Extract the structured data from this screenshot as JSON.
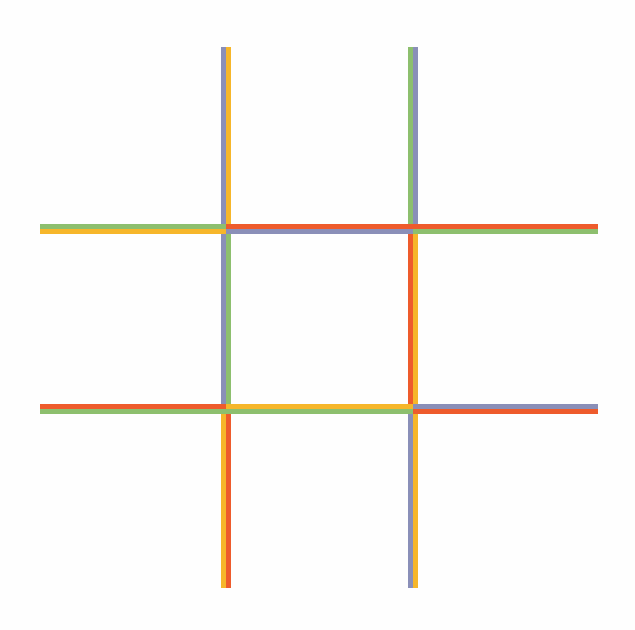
{
  "colors": {
    "gray": "#8a8fb8",
    "yellow": "#f6b62a",
    "green": "#8dbf6e",
    "red": "#ee5b2c",
    "background": "#fefefe"
  },
  "grid": {
    "vertical_lines": [
      {
        "x": 221,
        "segments": [
          {
            "name": "col1-top",
            "y1": 47,
            "y2": 225,
            "left": "gray",
            "right": "yellow"
          },
          {
            "name": "col1-middle",
            "y1": 225,
            "y2": 410,
            "left": "gray",
            "right": "green"
          },
          {
            "name": "col1-bottom",
            "y1": 410,
            "y2": 588,
            "left": "yellow",
            "right": "red"
          }
        ]
      },
      {
        "x": 408,
        "segments": [
          {
            "name": "col2-top",
            "y1": 47,
            "y2": 225,
            "left": "green",
            "right": "gray"
          },
          {
            "name": "col2-middle",
            "y1": 225,
            "y2": 410,
            "left": "red",
            "right": "yellow"
          },
          {
            "name": "col2-bottom",
            "y1": 410,
            "y2": 588,
            "left": "gray",
            "right": "yellow"
          }
        ]
      }
    ],
    "horizontal_lines": [
      {
        "y": 224,
        "segments": [
          {
            "name": "row1-left",
            "x1": 40,
            "x2": 226,
            "top": "green",
            "bottom": "yellow"
          },
          {
            "name": "row1-middle",
            "x1": 226,
            "x2": 413,
            "top": "red",
            "bottom": "gray"
          },
          {
            "name": "row1-right",
            "x1": 413,
            "x2": 598,
            "top": "red",
            "bottom": "green"
          }
        ]
      },
      {
        "y": 404,
        "segments": [
          {
            "name": "row2-left",
            "x1": 40,
            "x2": 226,
            "top": "red",
            "bottom": "green"
          },
          {
            "name": "row2-middle",
            "x1": 226,
            "x2": 413,
            "top": "yellow",
            "bottom": "green"
          },
          {
            "name": "row2-right",
            "x1": 413,
            "x2": 598,
            "top": "gray",
            "bottom": "red"
          }
        ]
      }
    ],
    "line_thickness": 10
  }
}
